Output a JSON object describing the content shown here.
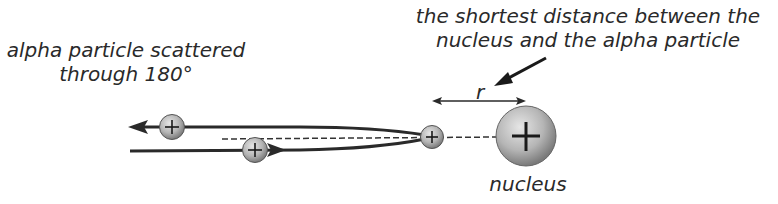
{
  "diagram": {
    "labels": {
      "scattered_line1": "alpha particle scattered",
      "scattered_line2": "through 180°",
      "shortest_line1": "the shortest distance between the",
      "shortest_line2": "nucleus and the alpha particle",
      "distance_symbol": "r",
      "nucleus": "nucleus"
    },
    "elements": {
      "nucleus": {
        "cx": 526,
        "cy": 136,
        "r": 30,
        "charge": "+"
      },
      "alpha_closest": {
        "cx": 432,
        "cy": 137,
        "r": 11,
        "charge": "+"
      },
      "alpha_incoming": {
        "cx": 255,
        "cy": 150,
        "r": 12,
        "charge": "+"
      },
      "alpha_returning": {
        "cx": 172,
        "cy": 127,
        "r": 12,
        "charge": "+"
      }
    },
    "colors": {
      "particle_fill": "#b8b8b8",
      "particle_stroke": "#555555",
      "line": "#2a2a2a",
      "text": "#2a2a2a"
    },
    "icons": {
      "plus": "plus-sign-icon",
      "arrowhead": "arrowhead-icon",
      "double_arrow": "double-headed-arrow-icon"
    }
  }
}
